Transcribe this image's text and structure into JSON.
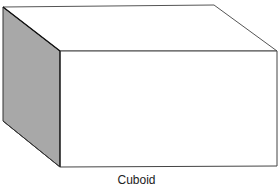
{
  "diagram": {
    "shape": "cuboid",
    "label": "Cuboid",
    "colors": {
      "shaded_face": "#a8a8a8",
      "face": "#ffffff",
      "edge": "#3a3a3a",
      "background": "#ffffff"
    },
    "faces": [
      "top",
      "front",
      "left-side (shaded)"
    ]
  }
}
